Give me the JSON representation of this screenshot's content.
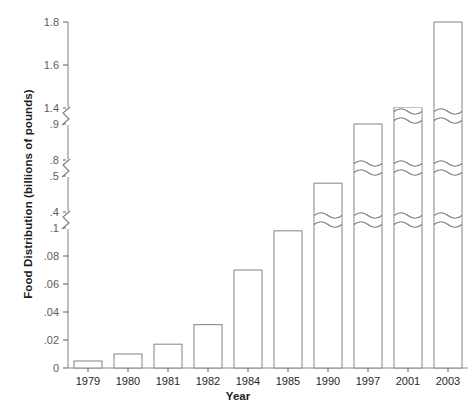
{
  "chart_data": {
    "type": "bar",
    "title": "",
    "subtitle": "",
    "xlabel": "Year",
    "ylabel": "Food Distribution (billions of pounds)",
    "categories": [
      "1979",
      "1980",
      "1981",
      "1982",
      "1984",
      "1985",
      "1990",
      "1997",
      "2001",
      "2003"
    ],
    "values": [
      0.005,
      0.01,
      0.017,
      0.031,
      0.07,
      0.098,
      0.48,
      0.9,
      1.4,
      1.8
    ],
    "series": [
      {
        "name": "Food Distribution",
        "values": [
          0.005,
          0.01,
          0.017,
          0.031,
          0.07,
          0.098,
          0.48,
          0.9,
          1.4,
          1.8
        ]
      }
    ],
    "ytick_labels": [
      "0",
      ".02",
      ".04",
      ".06",
      ".08",
      ".1",
      ".4",
      ".5",
      ".8",
      ".9",
      "1.4",
      "1.6",
      "1.8"
    ],
    "ytick_values": [
      0,
      0.02,
      0.04,
      0.06,
      0.08,
      0.1,
      0.4,
      0.5,
      0.8,
      0.9,
      1.4,
      1.6,
      1.8
    ],
    "y_axis_broken": true,
    "y_axis_segments": [
      {
        "min": 0,
        "max": 0.1
      },
      {
        "min": 0.4,
        "max": 0.5
      },
      {
        "min": 0.8,
        "max": 0.9
      },
      {
        "min": 1.4,
        "max": 1.8
      }
    ],
    "ylim": [
      0,
      1.8
    ],
    "grid": false,
    "legend": false,
    "legend_position": "none",
    "bar_fill_color": "#ffffff",
    "bar_border_color": "#8d8d8d",
    "axis_color": "#8a8a8a",
    "text_color": "#262626",
    "tick_label_color": "#5d5d5d",
    "background_color": "#ffffff",
    "annotations": [
      "Bars that cross an axis break are drawn with a wavy break glyph.",
      "1990, 1997, 2001 and 2003 bars carry break glyphs."
    ]
  }
}
